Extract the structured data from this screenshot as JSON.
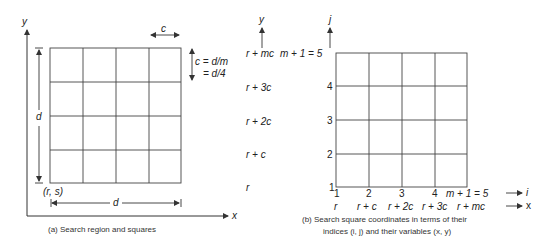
{
  "panel_a": {
    "axis_y_label": "y",
    "axis_x_label": "x",
    "cell_width_label": "c",
    "cell_formula_line1": "c = d/m",
    "cell_formula_line2": "= d/4",
    "height_label": "d",
    "width_label": "d",
    "origin_label": "(r, s)",
    "caption": "(a) Search region and squares",
    "grid": {
      "rows": 4,
      "cols": 4
    }
  },
  "panel_b": {
    "y_var_axis_label": "y",
    "j_axis_label": "j",
    "i_axis_label": "i",
    "x_var_axis_label": "x",
    "y_var_ticks": [
      "r + mc",
      "r + 3c",
      "r + 2c",
      "r + c",
      "r"
    ],
    "j_ticks": [
      "m + 1 = 5",
      "4",
      "3",
      "2",
      "1"
    ],
    "i_ticks": [
      "1",
      "2",
      "3",
      "4",
      "m + 1 = 5"
    ],
    "x_var_ticks": [
      "r",
      "r + c",
      "r + 2c",
      "r + 3c",
      "r + mc"
    ],
    "caption_line1": "(b) Search square coordinates in terms of their",
    "caption_line2": "indices (i, j) and their variables (x, y)",
    "grid": {
      "rows": 4,
      "cols": 4
    }
  },
  "colors": {
    "line": "#333333",
    "background": "#ffffff"
  }
}
